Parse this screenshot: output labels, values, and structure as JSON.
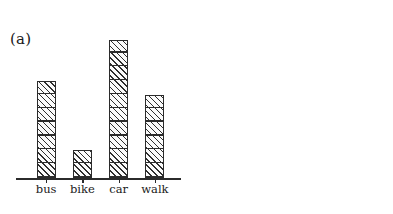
{
  "figure": {
    "background_color": "#ffffff",
    "ink_color": "#1a1a1a"
  },
  "panels": [
    {
      "caption": "(a)"
    },
    {
      "caption": "(b)"
    }
  ],
  "chart_data": [
    {
      "type": "bar",
      "title": "(a)",
      "subtitle": "",
      "categories": [
        "bus",
        "bike",
        "car",
        "walk"
      ],
      "values": [
        7,
        2,
        10,
        6
      ],
      "xlabel": "",
      "ylabel": "",
      "ylim": [
        0,
        11
      ],
      "yticks": [],
      "ytick_labels": [],
      "grid": false,
      "legend": null,
      "annotations": [],
      "notes": "Pictogram-style bar chart: each bar is divided into unit squares (one square per count). No y-axis or numeric scale is drawn; only a horizontal baseline with category tick marks. Bars are hatched with forward (/) diagonal lines."
    },
    {
      "type": "bar",
      "title": "(b)",
      "subtitle": "",
      "categories": [
        "bus",
        "bike",
        "car",
        "walk"
      ],
      "values": [
        7,
        2,
        10,
        6
      ],
      "xlabel": "",
      "ylabel": "",
      "ylim": [
        0,
        10
      ],
      "yticks": [
        0,
        1,
        2,
        3,
        4,
        5,
        6,
        7,
        8,
        9,
        10
      ],
      "ytick_labels": [
        "0",
        "1",
        "2",
        "3",
        "4",
        "5",
        "6",
        "7",
        "8",
        "9",
        "10"
      ],
      "grid": false,
      "legend": null,
      "annotations": [],
      "notes": "Standard bar chart with a vertical y-axis terminating in an upward arrowhead, tick marks labeled 0 through 10, and a horizontal x-axis with category tick marks. Bars are solid hatched with forward (/) diagonal lines."
    }
  ]
}
